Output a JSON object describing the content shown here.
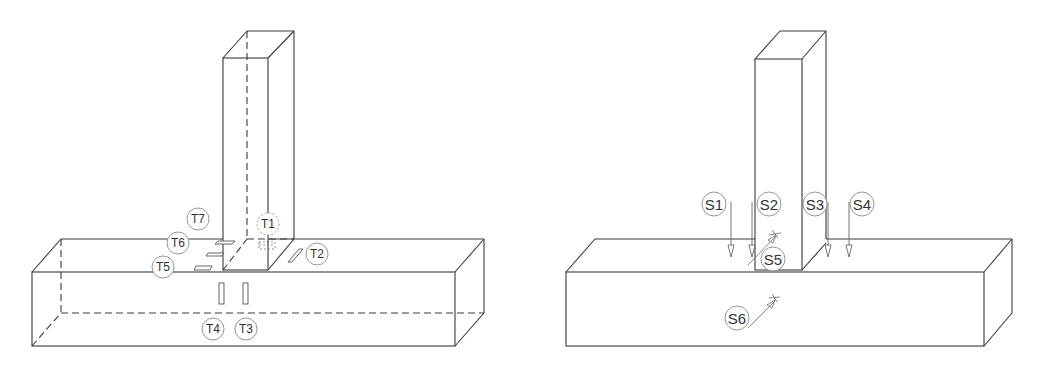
{
  "figure": {
    "background": "#ffffff",
    "line_color": "#3a3a3a",
    "panels": [
      {
        "id": "left",
        "title": "Strain gauge layout",
        "labels": [
          {
            "text": "T1",
            "x": 268,
            "y": 224,
            "dashed": true
          },
          {
            "text": "T2",
            "x": 317,
            "y": 254
          },
          {
            "text": "T3",
            "x": 246,
            "y": 329
          },
          {
            "text": "T4",
            "x": 213,
            "y": 329
          },
          {
            "text": "T5",
            "x": 163,
            "y": 267
          },
          {
            "text": "T6",
            "x": 178,
            "y": 243
          },
          {
            "text": "T7",
            "x": 198,
            "y": 219
          }
        ]
      },
      {
        "id": "right",
        "title": "Displacement transducer layout",
        "labels": [
          {
            "text": "S1",
            "x": 714,
            "y": 204
          },
          {
            "text": "S2",
            "x": 769,
            "y": 204
          },
          {
            "text": "S3",
            "x": 815,
            "y": 204
          },
          {
            "text": "S4",
            "x": 862,
            "y": 204
          },
          {
            "text": "S5",
            "x": 773,
            "y": 259
          },
          {
            "text": "S6",
            "x": 737,
            "y": 318
          }
        ]
      }
    ]
  }
}
